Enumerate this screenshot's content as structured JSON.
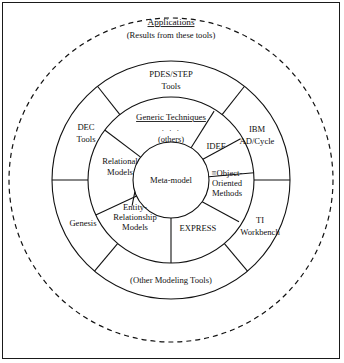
{
  "figure": {
    "title": "Applications",
    "subtitle": "(Results from these tools)",
    "center_label": "Meta-model",
    "generic_techniques_label": "Generic Techniques",
    "generic_dots": "· · ·",
    "others_label": "(others)",
    "other_modeling_tools_label": "(Other Modeling Tools)"
  },
  "rings": {
    "outer_tools": [
      {
        "id": "pdes-step-tools",
        "lines": [
          "PDES/STEP",
          "Tools"
        ]
      },
      {
        "id": "dec-tools",
        "lines": [
          "DEC",
          "Tools"
        ]
      },
      {
        "id": "genesis",
        "lines": [
          "Genesis"
        ]
      },
      {
        "id": "ibm-ad-cycle",
        "lines": [
          "IBM",
          "AD/Cycle"
        ]
      },
      {
        "id": "ti-workbench",
        "lines": [
          "TI",
          "Workbench"
        ]
      },
      {
        "id": "other-modeling-tools",
        "lines": [
          "(Other Modeling Tools)"
        ]
      }
    ],
    "middle_methods": [
      {
        "id": "generic-techniques",
        "lines": [
          "Generic Techniques"
        ]
      },
      {
        "id": "others",
        "lines": [
          "(others)"
        ]
      },
      {
        "id": "idef",
        "lines": [
          "IDEF"
        ]
      },
      {
        "id": "object-oriented-methods",
        "lines": [
          "≡Object-",
          "Oriented",
          "Methods"
        ]
      },
      {
        "id": "express",
        "lines": [
          "EXPRESS"
        ]
      },
      {
        "id": "entity-relationship-models",
        "lines": [
          "Entity-",
          "Relationship",
          "Models"
        ]
      },
      {
        "id": "relational-models",
        "lines": [
          "Relational",
          "Models"
        ]
      }
    ],
    "core": {
      "id": "meta-model",
      "lines": [
        "Meta-model"
      ]
    }
  },
  "colors": {
    "line": "#111111",
    "background": "#ffffff",
    "frame": "#1a1a1a"
  }
}
